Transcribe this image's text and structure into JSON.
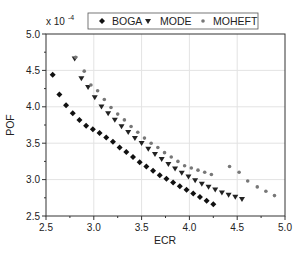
{
  "chart_data": {
    "type": "scatter",
    "title": "",
    "xlabel": "ECR",
    "ylabel": "POF",
    "y_multiplier_label": "x 10",
    "y_multiplier_exponent": "-4",
    "xlim": [
      2.5,
      5.0
    ],
    "ylim": [
      2.5,
      5.0
    ],
    "xticks": [
      "2.5",
      "3.0",
      "3.5",
      "4.0",
      "4.5",
      "5.0"
    ],
    "yticks": [
      "2.5",
      "3.0",
      "3.5",
      "4.0",
      "4.5",
      "5.0"
    ],
    "grid": true,
    "legend_position": "top",
    "series": [
      {
        "name": "BOGA",
        "marker": "diamond",
        "color": "#111111",
        "points": [
          [
            2.57,
            4.44
          ],
          [
            2.64,
            4.17
          ],
          [
            2.71,
            4.02
          ],
          [
            2.78,
            3.91
          ],
          [
            2.85,
            3.82
          ],
          [
            2.92,
            3.74
          ],
          [
            2.99,
            3.69
          ],
          [
            3.06,
            3.64
          ],
          [
            3.13,
            3.58
          ],
          [
            3.2,
            3.52
          ],
          [
            3.27,
            3.44
          ],
          [
            3.34,
            3.38
          ],
          [
            3.41,
            3.31
          ],
          [
            3.48,
            3.24
          ],
          [
            3.55,
            3.18
          ],
          [
            3.62,
            3.12
          ],
          [
            3.69,
            3.06
          ],
          [
            3.76,
            3.01
          ],
          [
            3.83,
            2.96
          ],
          [
            3.9,
            2.91
          ],
          [
            3.97,
            2.86
          ],
          [
            4.04,
            2.81
          ],
          [
            4.11,
            2.76
          ],
          [
            4.18,
            2.71
          ],
          [
            4.25,
            2.66
          ]
        ]
      },
      {
        "name": "MODE",
        "marker": "triangle-down",
        "color": "#222222",
        "points": [
          [
            2.8,
            4.66
          ],
          [
            2.87,
            4.39
          ],
          [
            2.94,
            4.27
          ],
          [
            3.01,
            4.13
          ],
          [
            3.08,
            4.0
          ],
          [
            3.15,
            3.91
          ],
          [
            3.22,
            3.82
          ],
          [
            3.29,
            3.73
          ],
          [
            3.36,
            3.65
          ],
          [
            3.43,
            3.57
          ],
          [
            3.5,
            3.5
          ],
          [
            3.57,
            3.42
          ],
          [
            3.64,
            3.35
          ],
          [
            3.71,
            3.28
          ],
          [
            3.78,
            3.21
          ],
          [
            3.85,
            3.15
          ],
          [
            3.92,
            3.09
          ],
          [
            3.99,
            3.04
          ],
          [
            4.06,
            2.99
          ],
          [
            4.13,
            2.94
          ],
          [
            4.2,
            2.9
          ],
          [
            4.27,
            2.86
          ],
          [
            4.34,
            2.82
          ],
          [
            4.41,
            2.79
          ],
          [
            4.48,
            2.76
          ],
          [
            4.55,
            2.73
          ]
        ]
      },
      {
        "name": "MOHEFT",
        "marker": "star",
        "color": "#777777",
        "points": [
          [
            2.81,
            4.68
          ],
          [
            2.9,
            4.49
          ],
          [
            2.97,
            4.3
          ],
          [
            3.04,
            4.22
          ],
          [
            3.11,
            4.1
          ],
          [
            3.18,
            3.99
          ],
          [
            3.25,
            3.9
          ],
          [
            3.32,
            3.82
          ],
          [
            3.39,
            3.73
          ],
          [
            3.46,
            3.65
          ],
          [
            3.53,
            3.57
          ],
          [
            3.6,
            3.5
          ],
          [
            3.67,
            3.44
          ],
          [
            3.74,
            3.37
          ],
          [
            3.81,
            3.31
          ],
          [
            3.88,
            3.25
          ],
          [
            3.95,
            3.19
          ],
          [
            4.02,
            3.16
          ],
          [
            4.09,
            3.13
          ],
          [
            4.16,
            3.1
          ],
          [
            4.23,
            3.07
          ],
          [
            4.42,
            3.18
          ],
          [
            4.52,
            3.1
          ],
          [
            4.61,
            2.98
          ],
          [
            4.71,
            2.9
          ],
          [
            4.8,
            2.84
          ],
          [
            4.89,
            2.78
          ]
        ]
      }
    ]
  }
}
